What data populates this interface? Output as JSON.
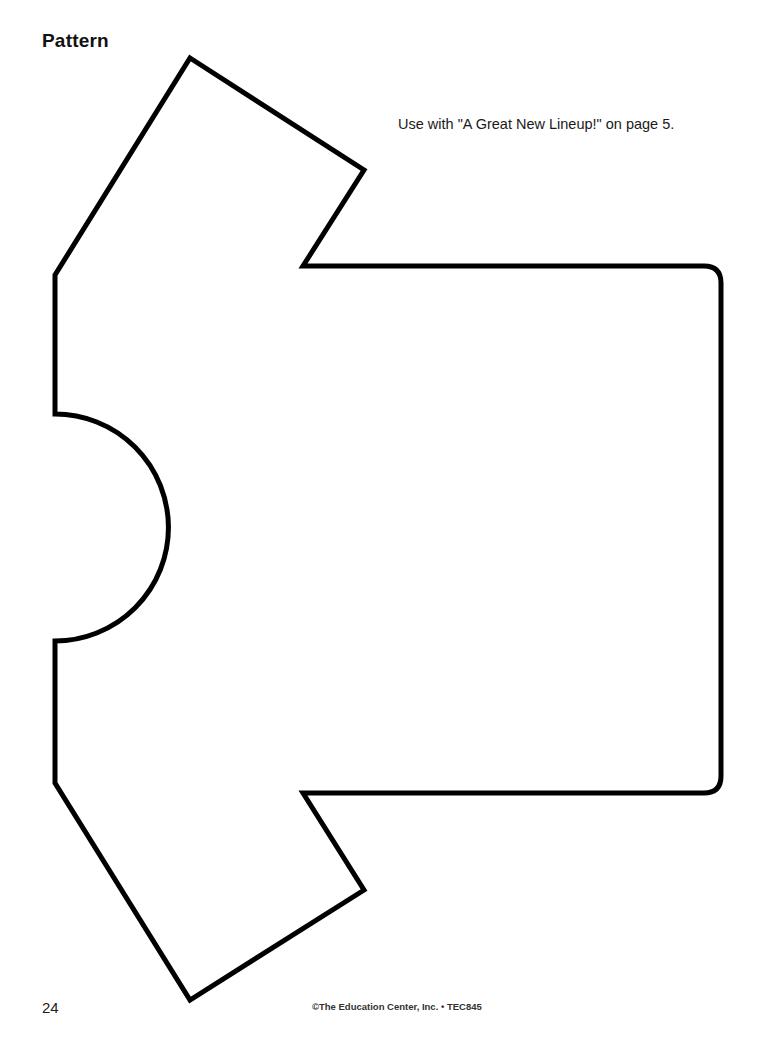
{
  "header": {
    "title": "Pattern"
  },
  "note": {
    "text": "Use with \"A Great New Lineup!\" on page 5."
  },
  "pattern": {
    "shape": "t-shirt-outline",
    "stroke_color": "#000000",
    "fill_color": "#ffffff"
  },
  "footer": {
    "page_number": "24",
    "copyright": "©The Education Center, Inc. • TEC845"
  }
}
